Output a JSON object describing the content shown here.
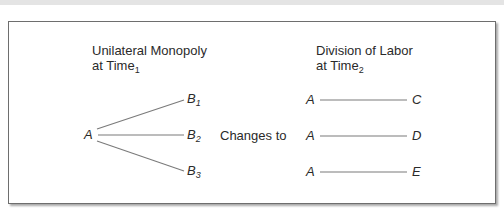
{
  "diagram": {
    "left_panel": {
      "title_line1": "Unilateral Monopoly",
      "title_line2": "at Time",
      "title_subscript": "1",
      "source_node": "A",
      "targets": [
        {
          "label": "B",
          "subscript": "1"
        },
        {
          "label": "B",
          "subscript": "2"
        },
        {
          "label": "B",
          "subscript": "3"
        }
      ]
    },
    "transition_label": "Changes to",
    "right_panel": {
      "title_line1": "Division of Labor",
      "title_line2": "at Time",
      "title_subscript": "2",
      "pairs": [
        {
          "from": "A",
          "to": "C"
        },
        {
          "from": "A",
          "to": "D"
        },
        {
          "from": "A",
          "to": "E"
        }
      ]
    },
    "colors": {
      "line": "#7a7a7a",
      "text": "#2a2a2a",
      "border": "#6e6e6e",
      "top_bar": "#e4e4e4"
    }
  }
}
